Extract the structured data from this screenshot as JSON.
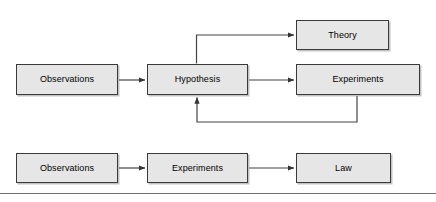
{
  "diagram": {
    "background_color": "#ffffff",
    "node_fill_color": "#e6e6e6",
    "node_border_color": "#3a3a3a",
    "edge_color": "#444444",
    "divider_color": "#6d6d6d",
    "nodes": [
      {
        "id": "observations-top",
        "label": "Observations",
        "x": 16,
        "y": 64,
        "w": 102,
        "h": 31
      },
      {
        "id": "hypothesis",
        "label": "Hypothesis",
        "x": 147,
        "y": 64,
        "w": 101,
        "h": 31
      },
      {
        "id": "theory",
        "label": "Theory",
        "x": 296,
        "y": 20,
        "w": 93,
        "h": 30
      },
      {
        "id": "experiments-top",
        "label": "Experiments",
        "x": 296,
        "y": 64,
        "w": 124,
        "h": 31
      },
      {
        "id": "observations-bottom",
        "label": "Observations",
        "x": 16,
        "y": 153,
        "w": 102,
        "h": 30
      },
      {
        "id": "experiments-bottom",
        "label": "Experiments",
        "x": 147,
        "y": 153,
        "w": 101,
        "h": 30
      },
      {
        "id": "law",
        "label": "Law",
        "x": 296,
        "y": 153,
        "w": 95,
        "h": 30
      }
    ],
    "edges": [
      {
        "id": "observations-to-hypothesis",
        "from": "observations-top",
        "to": "hypothesis",
        "kind": "straight-arrow"
      },
      {
        "id": "hypothesis-to-theory",
        "from": "hypothesis",
        "to": "theory",
        "kind": "elbow-arrow-up"
      },
      {
        "id": "hypothesis-to-experiments",
        "from": "hypothesis",
        "to": "experiments-top",
        "kind": "straight-arrow"
      },
      {
        "id": "experiments-to-hypothesis-feedback",
        "from": "experiments-top",
        "to": "hypothesis",
        "kind": "elbow-arrow-feedback"
      },
      {
        "id": "observations-to-experiments",
        "from": "observations-bottom",
        "to": "experiments-bottom",
        "kind": "straight-arrow"
      },
      {
        "id": "experiments-to-law",
        "from": "experiments-bottom",
        "to": "law",
        "kind": "straight-arrow"
      }
    ]
  }
}
